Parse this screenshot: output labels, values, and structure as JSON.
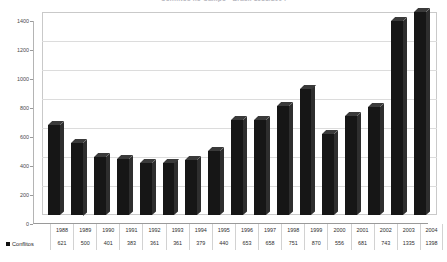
{
  "chart_data": {
    "type": "bar",
    "title": "Conflitos no Campo - Brasil 1988/2004",
    "xlabel": "",
    "ylabel": "",
    "ylim": [
      0,
      1400
    ],
    "yticks": [
      0,
      200,
      400,
      600,
      800,
      1000,
      1200,
      1400
    ],
    "grid": true,
    "legend_position": "bottom-left",
    "series_name": "Conflitos",
    "series_color": "#161616",
    "categories": [
      "1988",
      "1989",
      "1990",
      "1991",
      "1992",
      "1993",
      "1994",
      "1995",
      "1996",
      "1997",
      "1998",
      "1999",
      "2000",
      "2001",
      "2002",
      "2003",
      "2004"
    ],
    "values": [
      621,
      500,
      401,
      383,
      361,
      361,
      379,
      440,
      653,
      658,
      751,
      870,
      556,
      681,
      743,
      1335,
      1398
    ],
    "series": [
      {
        "name": "Conflitos",
        "values": [
          621,
          500,
          401,
          383,
          361,
          361,
          379,
          440,
          653,
          658,
          751,
          870,
          556,
          681,
          743,
          1335,
          1398
        ]
      }
    ]
  },
  "legend": {
    "label": "Conflitos",
    "marker": "square-marker"
  },
  "table": {
    "years": [
      "1988",
      "1989",
      "1990",
      "1991",
      "1992",
      "1993",
      "1994",
      "1995",
      "1996",
      "1997",
      "1998",
      "1999",
      "2000",
      "2001",
      "2002",
      "2003",
      "2004"
    ],
    "values": [
      "621",
      "500",
      "401",
      "383",
      "361",
      "361",
      "379",
      "440",
      "653",
      "658",
      "751",
      "870",
      "556",
      "681",
      "743",
      "1335",
      "1398"
    ]
  },
  "axis": {
    "y_ticks": [
      "1400",
      "1200",
      "1000",
      "800",
      "600",
      "400",
      "200",
      "0"
    ]
  }
}
